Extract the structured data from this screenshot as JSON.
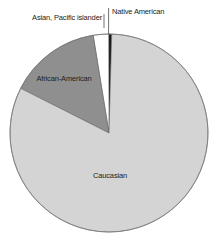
{
  "chart_data": {
    "type": "pie",
    "title": "",
    "categories": [
      "Caucasian",
      "African-American",
      "Asian, Pacific islander",
      "Native American"
    ],
    "values": [
      82,
      15,
      2.5,
      0.5
    ],
    "unit": "percent (estimated)",
    "start_angle_deg": 0,
    "direction": "counterclockwise-from-top for minor slices; Caucasian fills remainder",
    "colors": {
      "Caucasian": "#d4d4d4",
      "African-American": "#8f8f8f",
      "Asian, Pacific islander": "#ffffff",
      "Native American": "#1a1a1a"
    },
    "labels": {
      "caucasian": "Caucasian",
      "african_american": "African-American",
      "asian": "Asian, Pacific islander",
      "native_american": "Native American"
    },
    "legend": "none (data labels on/near slices)"
  }
}
